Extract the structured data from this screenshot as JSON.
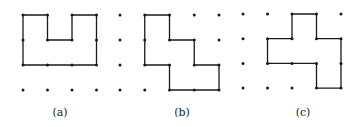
{
  "figures": [
    {
      "id": "a",
      "label": "(a)",
      "origin": [
        23,
        15
      ],
      "spacing": [
        24.5,
        25
      ],
      "cols": 4,
      "rows": 4,
      "polygon": [
        [
          0,
          0
        ],
        [
          1,
          0
        ],
        [
          1,
          1
        ],
        [
          2,
          1
        ],
        [
          2,
          0
        ],
        [
          3,
          0
        ],
        [
          3,
          2
        ],
        [
          0,
          2
        ]
      ],
      "label_pos": [
        60,
        116
      ]
    },
    {
      "id": "b",
      "label": "(b)",
      "origin": [
        120,
        15
      ],
      "spacing": [
        24.75,
        25
      ],
      "cols": 5,
      "rows": 4,
      "polygon": [
        [
          1,
          0
        ],
        [
          2,
          0
        ],
        [
          2,
          1
        ],
        [
          3,
          1
        ],
        [
          3,
          2
        ],
        [
          4,
          2
        ],
        [
          4,
          3
        ],
        [
          2,
          3
        ],
        [
          2,
          2
        ],
        [
          1,
          2
        ]
      ],
      "label_pos": [
        182,
        116
      ]
    },
    {
      "id": "c",
      "label": "(c)",
      "origin": [
        243,
        14
      ],
      "spacing": [
        24.5,
        24.7
      ],
      "cols": 5,
      "rows": 4,
      "polygon": [
        [
          2,
          0
        ],
        [
          3,
          0
        ],
        [
          3,
          1
        ],
        [
          4,
          1
        ],
        [
          4,
          3
        ],
        [
          3,
          3
        ],
        [
          3,
          2
        ],
        [
          1,
          2
        ],
        [
          1,
          1
        ],
        [
          2,
          1
        ]
      ],
      "label_pos": [
        303,
        116
      ]
    }
  ],
  "colors": {
    "line": "#1a1a1a",
    "dot": "#1a1a1a",
    "background": "#ffffff"
  }
}
